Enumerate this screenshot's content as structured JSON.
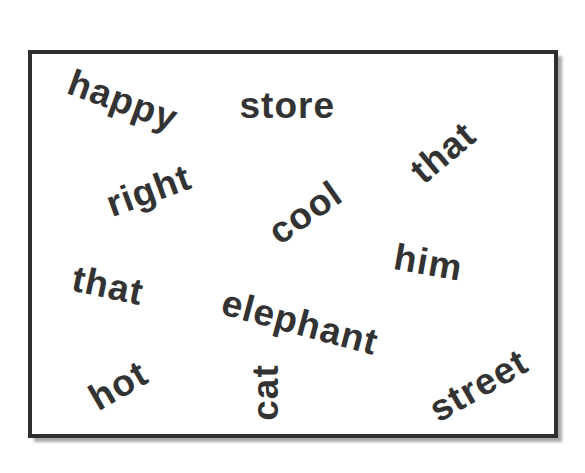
{
  "card": {
    "border_color": "#2e2e2e",
    "text_color": "#333333"
  },
  "words": [
    {
      "text": "happy",
      "cx": 123,
      "cy": 100,
      "rotate": 20
    },
    {
      "text": "store",
      "cx": 287,
      "cy": 105,
      "rotate": 0
    },
    {
      "text": "that",
      "cx": 443,
      "cy": 152,
      "rotate": -40
    },
    {
      "text": "right",
      "cx": 148,
      "cy": 190,
      "rotate": -20
    },
    {
      "text": "cool",
      "cx": 305,
      "cy": 212,
      "rotate": -35
    },
    {
      "text": "him",
      "cx": 428,
      "cy": 262,
      "rotate": 10
    },
    {
      "text": "that",
      "cx": 108,
      "cy": 285,
      "rotate": 12
    },
    {
      "text": "elephant",
      "cx": 300,
      "cy": 322,
      "rotate": 15
    },
    {
      "text": "hot",
      "cx": 118,
      "cy": 385,
      "rotate": -30
    },
    {
      "text": "cat",
      "cx": 265,
      "cy": 392,
      "rotate": -90
    },
    {
      "text": "street",
      "cx": 478,
      "cy": 385,
      "rotate": -30
    }
  ]
}
